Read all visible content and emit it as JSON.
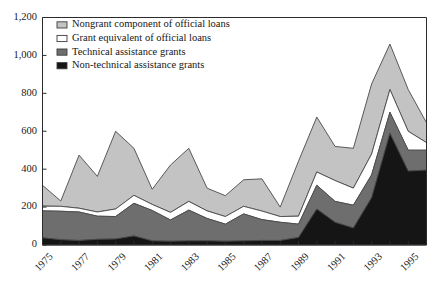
{
  "chart_data": {
    "type": "area",
    "stacked": true,
    "title": "",
    "subtitle": "",
    "xlabel": "",
    "ylabel": "",
    "ylim": [
      0,
      1200
    ],
    "yticks": [
      0,
      200,
      400,
      600,
      800,
      1000,
      1200
    ],
    "ytick_labels": [
      "0",
      "200",
      "400",
      "600",
      "800",
      "1,000",
      "1,200"
    ],
    "xlim": [
      1975,
      1996
    ],
    "x": [
      1975,
      1976,
      1977,
      1978,
      1979,
      1980,
      1981,
      1982,
      1983,
      1984,
      1985,
      1986,
      1987,
      1988,
      1989,
      1990,
      1991,
      1992,
      1993,
      1994,
      1995,
      1996
    ],
    "xticks": [
      1975,
      1977,
      1979,
      1981,
      1983,
      1985,
      1987,
      1989,
      1991,
      1993,
      1995
    ],
    "xtick_labels": [
      "1975",
      "1977",
      "1979",
      "1981",
      "1983",
      "1985",
      "1987",
      "1989",
      "1991",
      "1993",
      "1995"
    ],
    "grid": false,
    "legend_position": "top-left",
    "series": [
      {
        "name": "Non-technical assistance grants",
        "color": "#151515",
        "order": 1,
        "values": [
          38,
          28,
          24,
          30,
          32,
          48,
          22,
          20,
          22,
          22,
          20,
          22,
          24,
          24,
          40,
          190,
          120,
          90,
          250,
          590,
          390,
          395
        ]
      },
      {
        "name": "Technical assistance grants",
        "color": "#6e6e6e",
        "order": 2,
        "values": [
          142,
          150,
          150,
          122,
          118,
          172,
          160,
          112,
          162,
          118,
          90,
          142,
          110,
          96,
          70,
          125,
          110,
          120,
          120,
          110,
          110,
          105
        ]
      },
      {
        "name": "Grant equivalent of official loans",
        "color": "#ffffff",
        "order": 3,
        "values": [
          25,
          26,
          20,
          22,
          40,
          42,
          32,
          40,
          46,
          40,
          40,
          40,
          45,
          30,
          42,
          70,
          110,
          90,
          110,
          120,
          100,
          40
        ]
      },
      {
        "name": "Nongrant component of official loans",
        "color": "#c3c3c3",
        "order": 4,
        "values": [
          110,
          28,
          280,
          188,
          410,
          248,
          80,
          250,
          280,
          120,
          110,
          140,
          170,
          50,
          290,
          290,
          180,
          210,
          370,
          240,
          220,
          105
        ]
      }
    ],
    "series_totals_note": "stacked totals: 1975 315, 1976 232, 1977 474, 1978 362, 1979 600, 1980 510, 1981 294, 1982 422, 1983 510, 1984 300, 1985 260, 1986 344, 1987 349, 1988 200, 1989 442, 1990 675, 1991 520, 1992 510, 1993 850, 1994 1060, 1995 820, 1996 645"
  },
  "legend": {
    "items": [
      {
        "label": "Nongrant component of official loans",
        "swatch": "#c3c3c3",
        "icon": "legend-swatch-light-gray"
      },
      {
        "label": "Grant equivalent of official loans",
        "swatch": "#ffffff",
        "icon": "legend-swatch-white"
      },
      {
        "label": "Technical assistance grants",
        "swatch": "#6e6e6e",
        "icon": "legend-swatch-mid-gray"
      },
      {
        "label": "Non-technical assistance grants",
        "swatch": "#151515",
        "icon": "legend-swatch-black"
      }
    ]
  }
}
